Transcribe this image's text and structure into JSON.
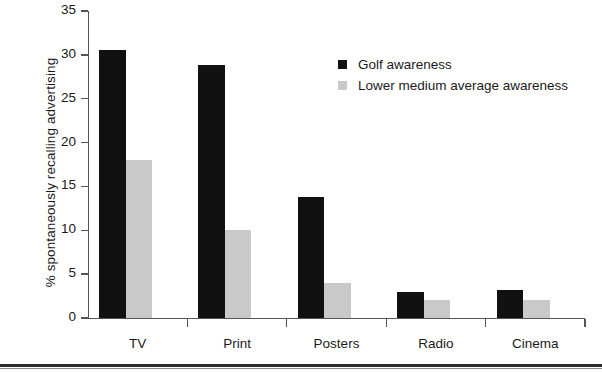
{
  "chart_data": {
    "type": "bar",
    "title": "",
    "subtitle": "",
    "xlabel": "",
    "ylabel": "% spontaneously recalling advertising",
    "categories": [
      "TV",
      "Print",
      "Posters",
      "Radio",
      "Cinema"
    ],
    "series": [
      {
        "name": "Golf awareness",
        "color": "#111111",
        "values": [
          30.5,
          28.8,
          13.8,
          3.0,
          3.2
        ]
      },
      {
        "name": "Lower medium average awareness",
        "color": "#c9c9c9",
        "values": [
          18.0,
          10.0,
          4.0,
          2.0,
          2.0
        ]
      }
    ],
    "ylim": [
      0,
      35
    ],
    "ytick_labels": [
      "35",
      "30",
      "25",
      "20",
      "15",
      "10",
      "5",
      "0"
    ],
    "ytick_values": [
      35,
      30,
      25,
      20,
      15,
      10,
      5,
      0
    ],
    "grid": false,
    "legend_position": "upper-right-inside"
  }
}
